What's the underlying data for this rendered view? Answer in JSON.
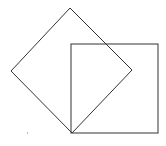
{
  "canvas": {
    "width": 166,
    "height": 146,
    "background": "#ffffff"
  },
  "stroke_color": "#333333",
  "shapes": {
    "diamond": {
      "points": "70,8 132,70 72,133 11,71"
    },
    "square": {
      "x": 71,
      "y": 44,
      "width": 87,
      "height": 89
    }
  },
  "speck": {
    "x": 27,
    "y": 132,
    "color": "#bbbbbb"
  }
}
